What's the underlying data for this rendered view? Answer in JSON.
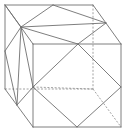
{
  "diagram": {
    "type": "cube-with-inscribed-polygon",
    "colors": {
      "line": "#6f6f6f",
      "hidden_line": "#8a8a8a",
      "background": "#ffffff"
    },
    "points": {
      "A": [
        5,
        5
      ],
      "B": [
        93,
        5
      ],
      "C": [
        121,
        44
      ],
      "D": [
        33,
        44
      ],
      "E": [
        5,
        89
      ],
      "F": [
        93,
        89
      ],
      "G": [
        121,
        127
      ],
      "H": [
        33,
        127
      ],
      "M_top": [
        53,
        5
      ],
      "P": [
        21,
        27
      ],
      "M_right_top": [
        106,
        23
      ],
      "M_front_top": [
        78,
        44
      ],
      "M_left": [
        5,
        51
      ],
      "M_front_left": [
        33,
        87
      ],
      "M_right": [
        121,
        87
      ],
      "M_low_left": [
        17,
        105
      ],
      "M_bottom": [
        77,
        127
      ]
    },
    "solid_edges": [
      [
        "A",
        "B"
      ],
      [
        "B",
        "C"
      ],
      [
        "C",
        "D"
      ],
      [
        "D",
        "A"
      ],
      [
        "D",
        "H"
      ],
      [
        "H",
        "G"
      ],
      [
        "G",
        "C"
      ],
      [
        "A",
        "E"
      ],
      [
        "E",
        "H"
      ],
      [
        "A",
        "P"
      ],
      [
        "M_top",
        "P"
      ],
      [
        "P",
        "M_right_top"
      ],
      [
        "P",
        "M_front_top"
      ],
      [
        "M_top",
        "M_right_top"
      ],
      [
        "M_right_top",
        "M_front_top"
      ],
      [
        "P",
        "M_left"
      ],
      [
        "P",
        "M_front_left"
      ],
      [
        "P",
        "M_low_left"
      ],
      [
        "M_left",
        "M_low_left"
      ],
      [
        "M_low_left",
        "M_front_left"
      ],
      [
        "M_front_top",
        "M_front_left"
      ],
      [
        "M_front_left",
        "M_bottom"
      ],
      [
        "M_bottom",
        "M_right"
      ],
      [
        "M_right",
        "M_front_top"
      ]
    ],
    "hidden_edges": [
      [
        "B",
        "F"
      ],
      [
        "E",
        "F"
      ],
      [
        "F",
        "G"
      ],
      [
        "M_front_left",
        "F"
      ]
    ]
  }
}
